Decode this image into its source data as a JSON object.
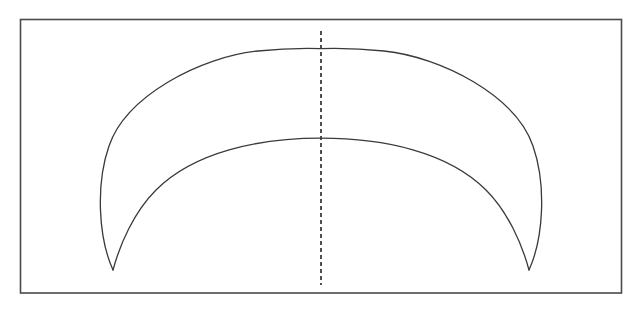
{
  "figure": {
    "canvas": {
      "width": 641,
      "height": 311,
      "background": "#ffffff"
    },
    "frame": {
      "name": "rectangular border",
      "x": 20.5,
      "y": 19.5,
      "width": 601,
      "height": 273.5,
      "stroke": "#4a4a4a",
      "stroke_width": 1.6,
      "fill": "#ffffff"
    },
    "cusps": {
      "left": {
        "x": 113,
        "y": 270
      },
      "right": {
        "x": 532,
        "y": 270
      }
    },
    "outer_arc": {
      "name": "outer crescent arc",
      "apex": {
        "x": 321,
        "y": 49
      },
      "leftmost": {
        "x": 98,
        "y": 200
      },
      "rightmost": {
        "x": 549,
        "y": 200
      },
      "stroke": "#3a3a3a",
      "stroke_width": 1.3,
      "path": "M 113 270 C 98.5 238 95.5 185 109 146 C 126 96 200 57 258 51 C 281 48.6 299 48 321 48.6 C 343 48 361 48.6 384 51 C 442 57 516 96 533 146 C 546.5 185 543.5 238 529 270"
    },
    "inner_arc": {
      "name": "inner crescent arc",
      "apex": {
        "x": 321,
        "y": 139
      },
      "stroke": "#3a3a3a",
      "stroke_width": 1.3,
      "path": "M 113 270 C 120 244 134 212 156 190 C 194 152 258 138.2 321 138.2 C 384 138.2 448 152 486 190 C 508 212 522 244 529 270"
    },
    "axis": {
      "name": "vertical axis of symmetry",
      "x": 321,
      "y_top": 31,
      "y_bottom": 285,
      "stroke": "#3d3d3d",
      "stroke_width": 1.8,
      "dash_pattern": "4 3"
    }
  }
}
